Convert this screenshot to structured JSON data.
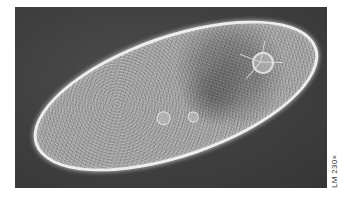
{
  "image": {
    "subject": "Paramecium (ciliate protozoan) under phase-contrast light microscopy",
    "background_color": "#3f3f3f",
    "cell_outline_color": "#eeeeee",
    "cell_body_color": "#a0a0a0",
    "page_background": "#ffffff"
  },
  "caption": {
    "magnification_label": "LM 230×"
  }
}
